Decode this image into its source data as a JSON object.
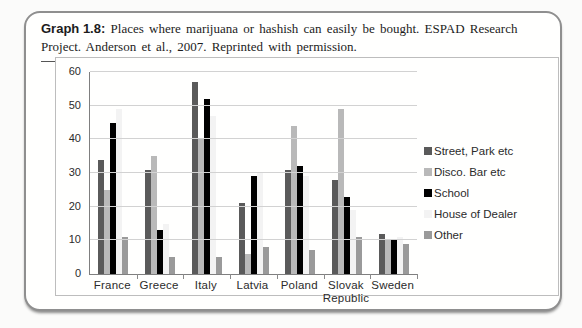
{
  "caption": {
    "label": "Graph 1.8:",
    "text": " Places where marijuana or hashish can easily be bought. ESPAD Research Project. Anderson et al., 2007. Reprinted with permission."
  },
  "chart_data": {
    "type": "bar",
    "title": "Graph 1.8: Places where marijuana or hashish can easily be bought. ESPAD Research Project. Anderson et al., 2007. Reprinted with permission.",
    "categories": [
      "France",
      "Greece",
      "Italy",
      "Latvia",
      "Poland",
      "Slovak Republic",
      "Sweden"
    ],
    "series": [
      {
        "name": "Street, Park etc",
        "color": "#5a5a5a",
        "values": [
          34,
          31,
          57,
          21,
          31,
          28,
          12
        ]
      },
      {
        "name": "Disco. Bar etc",
        "color": "#b9b9b9",
        "values": [
          25,
          35,
          40,
          6,
          44,
          49,
          10
        ]
      },
      {
        "name": "School",
        "color": "#000000",
        "values": [
          45,
          13,
          52,
          29,
          32,
          23,
          10
        ]
      },
      {
        "name": "House of Dealer",
        "color": "#f3f3f3",
        "values": [
          49,
          15,
          47,
          30,
          29,
          19,
          11
        ]
      },
      {
        "name": "Other",
        "color": "#9a9a9a",
        "values": [
          11,
          5,
          5,
          8,
          7,
          11,
          9
        ]
      }
    ],
    "xlabel": "",
    "ylabel": "",
    "ylim": [
      0,
      60
    ],
    "yticks": [
      0,
      10,
      20,
      30,
      40,
      50,
      60
    ],
    "grid": true,
    "legend_position": "right",
    "gridline_color": "#d2d2d2"
  }
}
